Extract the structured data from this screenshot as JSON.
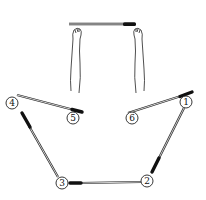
{
  "diagram": {
    "type": "instructional-illustration",
    "steps": [
      {
        "label": "1",
        "cx": 186,
        "cy": 102
      },
      {
        "label": "2",
        "cx": 147,
        "cy": 181
      },
      {
        "label": "3",
        "cx": 62,
        "cy": 183
      },
      {
        "label": "4",
        "cx": 12,
        "cy": 103
      },
      {
        "label": "5",
        "cx": 73,
        "cy": 118
      },
      {
        "label": "6",
        "cx": 132,
        "cy": 118
      }
    ],
    "colors": {
      "line": "#222222",
      "handle": "#111111",
      "background": "#ffffff"
    }
  }
}
